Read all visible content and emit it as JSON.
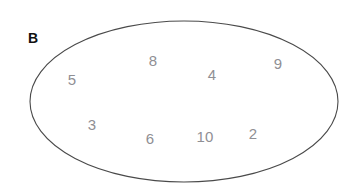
{
  "figure": {
    "label": "B",
    "label_color": "#111111",
    "background_color": "#ffffff",
    "element_color": "#8f8f94",
    "outline_color": "#4a4a4a"
  },
  "set": {
    "shape": "ellipse",
    "cx": 184,
    "cy": 101.5,
    "rx": 154,
    "ry": 80.5
  },
  "elements": [
    {
      "value": "5",
      "x": 72,
      "y": 79
    },
    {
      "value": "8",
      "x": 153,
      "y": 60
    },
    {
      "value": "4",
      "x": 212,
      "y": 74
    },
    {
      "value": "9",
      "x": 278,
      "y": 63
    },
    {
      "value": "3",
      "x": 92,
      "y": 124
    },
    {
      "value": "6",
      "x": 150,
      "y": 138
    },
    {
      "value": "10",
      "x": 205,
      "y": 136
    },
    {
      "value": "2",
      "x": 253,
      "y": 133
    }
  ],
  "chart_data": {
    "type": "diagram",
    "subtype": "venn-single-set",
    "title": "B",
    "sets": [
      {
        "name": "B",
        "members": [
          "5",
          "8",
          "4",
          "9",
          "3",
          "6",
          "10",
          "2"
        ]
      }
    ],
    "members_count": 8,
    "xlabel": "",
    "ylabel": ""
  }
}
